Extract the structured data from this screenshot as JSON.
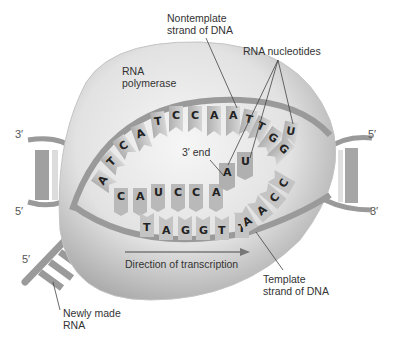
{
  "figure": {
    "labels": {
      "nontemplate": [
        "Nontemplate",
        "strand of DNA"
      ],
      "rna_nucleotides": "RNA nucleotides",
      "rna_polymerase": [
        "RNA",
        "polymerase"
      ],
      "three_prime_end": "3′ end",
      "direction": "Direction of transcription",
      "template": [
        "Template",
        "strand of DNA"
      ],
      "newly_made": [
        "Newly made",
        "RNA"
      ]
    },
    "strand_ends": {
      "left_top": "3′",
      "left_bottom": "5′",
      "right_top": "5′",
      "right_bottom": "3′",
      "rna_end": "5′"
    },
    "nontemplate_bases": [
      "A",
      "T",
      "C",
      "A",
      "T",
      "C",
      "C",
      "A",
      "A",
      "T",
      "T",
      "G",
      "G",
      "U"
    ],
    "rna_bases": [
      "C",
      "A",
      "U",
      "C",
      "C",
      "A",
      "A",
      "U"
    ],
    "template_bases": [
      "T",
      "A",
      "G",
      "G",
      "T",
      "T",
      "A",
      "A",
      "C",
      "C"
    ],
    "colors": {
      "polymerase": "#e3e3e3",
      "polymerase_shade": "#b5b5b5",
      "backbone": "#9a9a9a",
      "base_fill": "#c8c8c8",
      "text": "#333333"
    }
  }
}
